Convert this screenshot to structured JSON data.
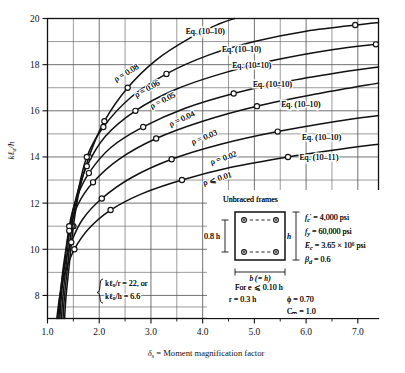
{
  "figure": {
    "caption": "",
    "xlabel_symbol": "δ",
    "xlabel_sub": "s",
    "xlabel_text": "= Moment magnification factor",
    "ylabel_text": "kℓᵤ/h"
  },
  "annotations": {
    "slenderness_line1": "kℓᵤ/r = 22, or",
    "slenderness_line2": "kℓᵤ/h = 6.6"
  },
  "inset": {
    "title": "Unbraced frames",
    "depth_label": "0.8 h",
    "height_label": "h",
    "width_label": "b (= h)",
    "props": [
      {
        "sym": "f",
        "sub": "c",
        "prime": true,
        "val": "= 4,000 psi"
      },
      {
        "sym": "f",
        "sub": "y",
        "prime": false,
        "val": "= 60,000 psi"
      },
      {
        "sym": "E",
        "sub": "c",
        "prime": false,
        "val": "= 3.65 × 10⁶ psi"
      },
      {
        "sym": "β",
        "sub": "d",
        "prime": false,
        "val": "= 0.6"
      }
    ],
    "note_line1": "For e ⩽ 0.10 h",
    "note_line2_left": "r = 0.3 h",
    "note_line2_right": "ϕ = 0.70",
    "note_line3_right": "Cₘ = 1.0"
  },
  "chart_data": {
    "type": "line",
    "title": "",
    "xlabel": "δs = Moment magnification factor",
    "ylabel": "kℓu/h",
    "xlim": [
      1.0,
      7.4
    ],
    "ylim": [
      7.0,
      20.0
    ],
    "xticks": [
      1.0,
      2.0,
      3.0,
      4.0,
      5.0,
      6.0,
      7.0
    ],
    "xticklabels": [
      "1.0",
      "2.0",
      "3.0",
      "4.0",
      "5.0",
      "6.0",
      "7.0"
    ],
    "xminor_step": 0.5,
    "yticks": [
      8,
      10,
      12,
      14,
      16,
      18,
      20
    ],
    "yticklabels": [
      "8",
      "10",
      "12",
      "14",
      "16",
      "18",
      "20"
    ],
    "yminor_step": 1,
    "grid": true,
    "legend": "inline-curve-labels",
    "marker": "open-circle",
    "series": [
      {
        "name": "ρ = 0.08",
        "label": "ρ = 0.08",
        "eq_label": "Eq. (10–10)",
        "eq_x": 4.05,
        "eq_y": 19.35,
        "label_x": 2.55,
        "label_y": 17.55,
        "label_rot": -31,
        "points": [
          [
            1.33,
            7.0
          ],
          [
            1.36,
            8.0
          ],
          [
            1.42,
            9.3
          ],
          [
            1.5,
            11.0
          ],
          [
            1.62,
            12.6
          ],
          [
            1.8,
            14.0
          ],
          [
            2.1,
            15.55
          ],
          [
            2.55,
            17.0
          ],
          [
            3.1,
            18.2
          ],
          [
            3.75,
            19.15
          ],
          [
            4.3,
            19.75
          ],
          [
            4.62,
            20.0
          ]
        ],
        "markers": [
          [
            1.5,
            11.0
          ],
          [
            1.8,
            14.0
          ],
          [
            2.1,
            15.55
          ],
          [
            2.55,
            17.0
          ]
        ]
      },
      {
        "name": "ρ = 0.06",
        "label": "ρ = 0.06",
        "eq_label": "Eq. (10–10)",
        "eq_x": 4.75,
        "eq_y": 18.55,
        "label_x": 2.95,
        "label_y": 16.85,
        "label_rot": -29,
        "points": [
          [
            1.3,
            7.0
          ],
          [
            1.33,
            8.0
          ],
          [
            1.39,
            9.3
          ],
          [
            1.47,
            11.0
          ],
          [
            1.58,
            12.4
          ],
          [
            1.76,
            14.0
          ],
          [
            2.08,
            15.3
          ],
          [
            2.62,
            16.6
          ],
          [
            3.3,
            17.6
          ],
          [
            4.1,
            18.4
          ],
          [
            5.0,
            19.0
          ],
          [
            6.0,
            19.45
          ],
          [
            7.1,
            19.75
          ],
          [
            7.4,
            19.82
          ]
        ],
        "markers": [
          [
            1.47,
            11.0
          ],
          [
            1.76,
            14.0
          ],
          [
            2.08,
            15.3
          ],
          [
            3.3,
            17.6
          ],
          [
            6.95,
            19.72
          ]
        ]
      },
      {
        "name": "ρ = 0.05",
        "label": "ρ = 0.05",
        "eq_label": "Eq. (10–10)",
        "eq_x": 4.95,
        "eq_y": 17.85,
        "label_x": 3.25,
        "label_y": 16.35,
        "label_rot": -27,
        "points": [
          [
            1.27,
            7.0
          ],
          [
            1.3,
            8.0
          ],
          [
            1.36,
            9.3
          ],
          [
            1.44,
            11.0
          ],
          [
            1.56,
            12.3
          ],
          [
            1.76,
            13.6
          ],
          [
            2.12,
            14.9
          ],
          [
            2.7,
            16.0
          ],
          [
            3.45,
            16.9
          ],
          [
            4.35,
            17.6
          ],
          [
            5.4,
            18.2
          ],
          [
            6.5,
            18.65
          ],
          [
            7.4,
            18.9
          ]
        ],
        "markers": [
          [
            1.44,
            11.0
          ],
          [
            1.76,
            13.6
          ],
          [
            2.7,
            16.0
          ],
          [
            7.35,
            18.88
          ]
        ]
      },
      {
        "name": "ρ = 0.04",
        "label": "ρ = 0.04",
        "eq_label": "Eq. (10–10)",
        "eq_x": 5.35,
        "eq_y": 17.05,
        "label_x": 3.62,
        "label_y": 15.55,
        "label_rot": -25,
        "points": [
          [
            1.24,
            7.0
          ],
          [
            1.27,
            8.0
          ],
          [
            1.33,
            9.3
          ],
          [
            1.42,
            11.0
          ],
          [
            1.56,
            12.2
          ],
          [
            1.8,
            13.3
          ],
          [
            2.22,
            14.4
          ],
          [
            2.85,
            15.3
          ],
          [
            3.65,
            16.1
          ],
          [
            4.6,
            16.75
          ],
          [
            5.7,
            17.3
          ],
          [
            6.9,
            17.75
          ],
          [
            7.4,
            17.9
          ]
        ],
        "markers": [
          [
            1.42,
            11.0
          ],
          [
            1.8,
            13.3
          ],
          [
            2.85,
            15.3
          ],
          [
            4.6,
            16.75
          ]
        ]
      },
      {
        "name": "ρ = 0.03",
        "label": "ρ = 0.03",
        "eq_label": "Eq. (10–10)",
        "eq_x": 5.9,
        "eq_y": 16.15,
        "label_x": 4.05,
        "label_y": 14.75,
        "label_rot": -22,
        "points": [
          [
            1.22,
            7.0
          ],
          [
            1.25,
            8.0
          ],
          [
            1.31,
            9.3
          ],
          [
            1.42,
            10.8
          ],
          [
            1.58,
            11.9
          ],
          [
            1.88,
            12.9
          ],
          [
            2.38,
            13.9
          ],
          [
            3.1,
            14.8
          ],
          [
            4.0,
            15.55
          ],
          [
            5.05,
            16.2
          ],
          [
            6.25,
            16.75
          ],
          [
            7.4,
            17.2
          ]
        ],
        "markers": [
          [
            1.42,
            10.8
          ],
          [
            1.88,
            12.9
          ],
          [
            3.1,
            14.8
          ],
          [
            5.05,
            16.2
          ]
        ]
      },
      {
        "name": "ρ = 0.02",
        "label": "ρ = 0.02",
        "eq_label": "Eq. (10–10)",
        "eq_x": 6.3,
        "eq_y": 14.75,
        "label_x": 4.42,
        "label_y": 13.85,
        "label_rot": -19,
        "points": [
          [
            1.2,
            7.0
          ],
          [
            1.24,
            8.0
          ],
          [
            1.32,
            9.2
          ],
          [
            1.46,
            10.3
          ],
          [
            1.68,
            11.3
          ],
          [
            2.05,
            12.2
          ],
          [
            2.62,
            13.1
          ],
          [
            3.4,
            13.9
          ],
          [
            4.35,
            14.55
          ],
          [
            5.45,
            15.1
          ],
          [
            6.6,
            15.55
          ],
          [
            7.4,
            15.8
          ]
        ],
        "markers": [
          [
            1.46,
            10.3
          ],
          [
            2.05,
            12.2
          ],
          [
            3.4,
            13.9
          ],
          [
            5.45,
            15.1
          ]
        ]
      },
      {
        "name": "ρ ⩽ 0.01",
        "label": "ρ ⩽ 0.01",
        "eq_label": "Eq. (10–11)",
        "eq_x": 6.25,
        "eq_y": 13.85,
        "label_x": 4.3,
        "label_y": 12.95,
        "label_rot": -17,
        "points": [
          [
            1.18,
            7.0
          ],
          [
            1.24,
            8.0
          ],
          [
            1.34,
            9.0
          ],
          [
            1.52,
            10.0
          ],
          [
            1.8,
            10.9
          ],
          [
            2.22,
            11.7
          ],
          [
            2.82,
            12.4
          ],
          [
            3.6,
            13.0
          ],
          [
            4.55,
            13.55
          ],
          [
            5.65,
            14.0
          ],
          [
            6.85,
            14.4
          ],
          [
            7.4,
            14.55
          ]
        ],
        "markers": [
          [
            1.52,
            10.0
          ],
          [
            2.22,
            11.7
          ],
          [
            3.6,
            13.0
          ],
          [
            5.65,
            14.0
          ]
        ]
      }
    ]
  }
}
